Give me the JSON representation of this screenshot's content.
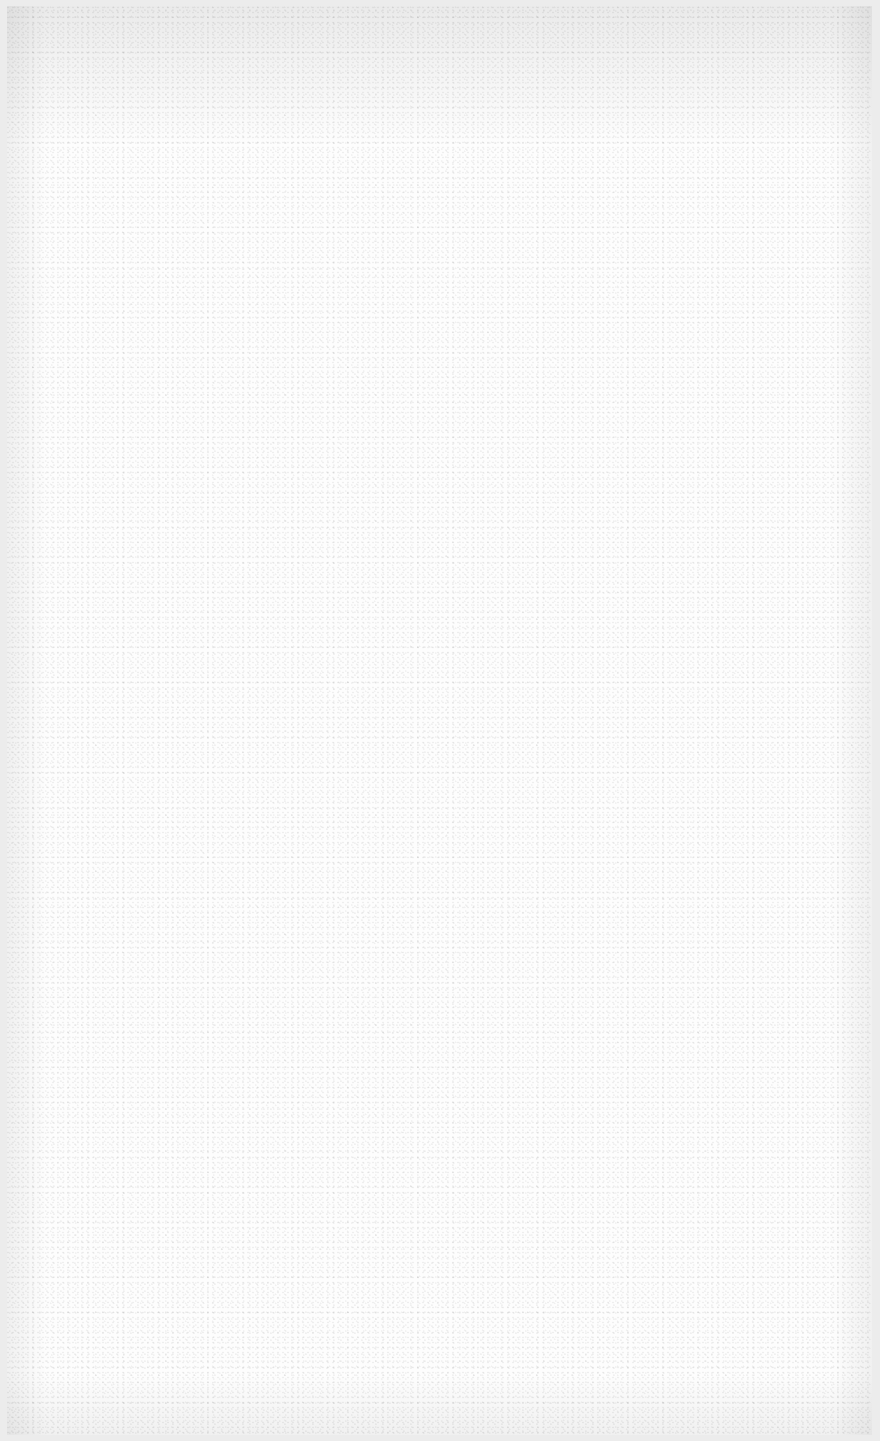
{
  "document": {
    "type": "blank-page",
    "text": "",
    "colors": {
      "paper": "#fdfdfd",
      "frame": "#ececec"
    }
  }
}
